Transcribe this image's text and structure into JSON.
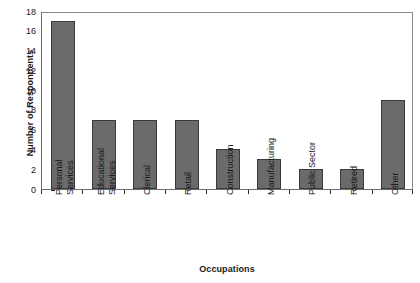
{
  "chart_data": {
    "type": "bar",
    "title": "",
    "xlabel": "Occupations",
    "ylabel": "Number of Respondents",
    "categories": [
      "Personal Services",
      "Educational Services",
      "Clerical",
      "Retail",
      "Construction",
      "Manufacturing",
      "Public Sector",
      "Retired",
      "Other"
    ],
    "category_lines": [
      [
        "Personal",
        "Services"
      ],
      [
        "Educational",
        "Services"
      ],
      [
        "Clerical"
      ],
      [
        "Retail"
      ],
      [
        "Construction"
      ],
      [
        "Manufacturing"
      ],
      [
        "Public Sector"
      ],
      [
        "Retired"
      ],
      [
        "Other"
      ]
    ],
    "values": [
      17,
      7,
      7,
      7,
      4,
      3,
      2,
      2,
      9
    ],
    "ylim": [
      0,
      18
    ],
    "yticks": [
      0,
      2,
      4,
      6,
      8,
      10,
      12,
      14,
      16,
      18
    ],
    "ytick_labels": [
      "0",
      "2",
      "4",
      "6",
      "8",
      "10",
      "12",
      "14",
      "16",
      "18"
    ],
    "grid": false,
    "legend": false,
    "legend_position": "none",
    "bar_color": "#6b6b6b",
    "bar_edge_color": "#3a3a3a",
    "axis_color": "#6f6f6f",
    "background_color": "#ffffff",
    "text_color": "#1a1a1a"
  }
}
